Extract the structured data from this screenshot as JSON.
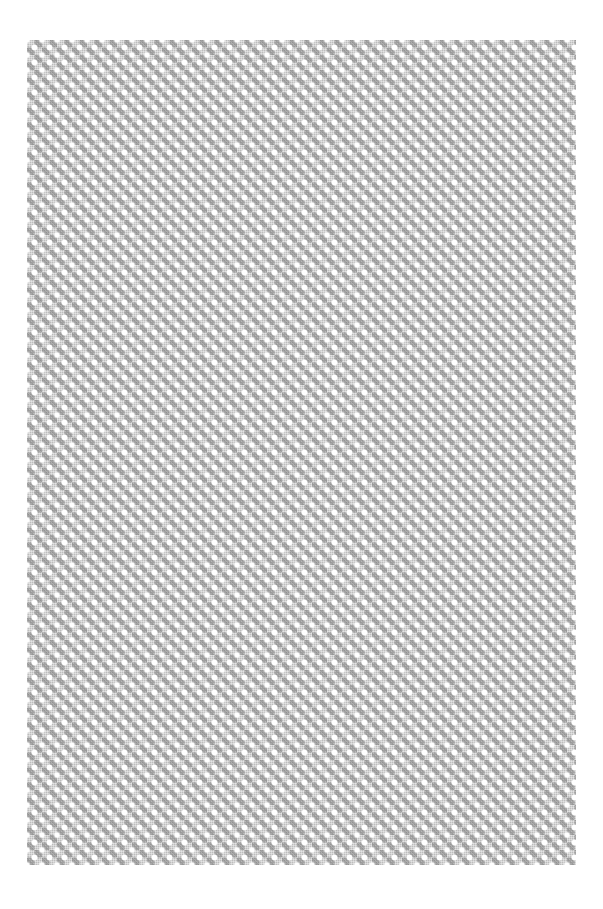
{
  "page": {
    "background": "#ffffff",
    "pattern": {
      "description": "diagonal lattice of white dots with gray diamond checker texture",
      "primary_color": "#bdbdbd",
      "dark_color": "#787878",
      "dot_color": "#ffffff",
      "tile_size_px": 15
    },
    "page_number": ""
  }
}
